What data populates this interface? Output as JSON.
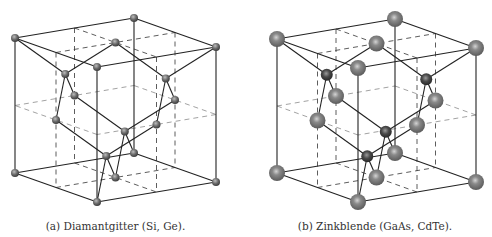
{
  "figure": {
    "panels": [
      {
        "id": "a",
        "caption": "(a) Diamantgitter (Si, Ge).",
        "structure": "diamond",
        "species": [
          "Si/Ge",
          "Si/Ge"
        ],
        "atom_colors": {
          "fcc": "#555555",
          "basis": "#555555"
        }
      },
      {
        "id": "b",
        "caption": "(b) Zinkblende (GaAs, CdTe).",
        "structure": "zincblende",
        "species": [
          "Ga/Cd",
          "As/Te"
        ],
        "atom_colors": {
          "fcc": "#6a6a6a",
          "basis": "#3a3a3a"
        }
      }
    ],
    "fcc_sites": [
      [
        0,
        0,
        0
      ],
      [
        1,
        0,
        0
      ],
      [
        0,
        1,
        0
      ],
      [
        1,
        1,
        0
      ],
      [
        0,
        0,
        1
      ],
      [
        1,
        0,
        1
      ],
      [
        0,
        1,
        1
      ],
      [
        1,
        1,
        1
      ],
      [
        0.5,
        0.5,
        0
      ],
      [
        0.5,
        0.5,
        1
      ],
      [
        0.5,
        0,
        0.5
      ],
      [
        0.5,
        1,
        0.5
      ],
      [
        0,
        0.5,
        0.5
      ],
      [
        1,
        0.5,
        0.5
      ]
    ],
    "basis_sites": [
      [
        0.25,
        0.25,
        0.25
      ],
      [
        0.75,
        0.75,
        0.25
      ],
      [
        0.75,
        0.25,
        0.75
      ],
      [
        0.25,
        0.75,
        0.75
      ]
    ],
    "bond_length_quarter": 0.25,
    "colors": {
      "edge": "#222222",
      "bond": "#222222",
      "dashed": "#333333",
      "midplane": "#8a8a8a"
    }
  }
}
